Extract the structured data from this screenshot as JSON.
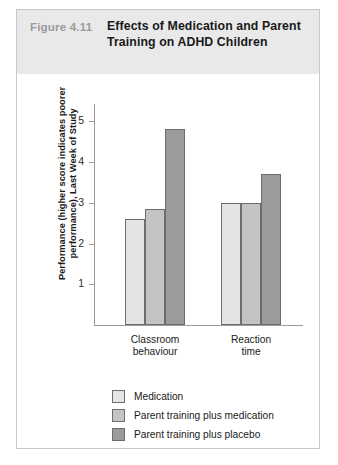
{
  "figure": {
    "number": "Figure 4.11",
    "title": "Effects of Medication and Parent Training on ADHD Children"
  },
  "chart_data": {
    "type": "bar",
    "title": "Effects of Medication and Parent Training on ADHD Children",
    "xlabel": "",
    "ylabel": "Performance (higher score indicates poorer performance), Last Week of Study",
    "categories": [
      "Classroom behaviour",
      "Reaction time"
    ],
    "series": [
      {
        "name": "Medication",
        "values": [
          2.6,
          3.0
        ],
        "color": "#e4e4e4"
      },
      {
        "name": "Parent training plus medication",
        "values": [
          2.85,
          3.0
        ],
        "color": "#c4c4c4"
      },
      {
        "name": "Parent training plus placebo",
        "values": [
          4.8,
          3.7
        ],
        "color": "#9b9b9b"
      }
    ],
    "yticks": [
      1,
      2,
      3,
      4,
      5
    ],
    "ylim": [
      0,
      5.45
    ],
    "grid": false,
    "legend_position": "bottom-left"
  },
  "colors": {
    "header_band": "#e9e9e9",
    "figure_number": "#9a9a9a",
    "title_text": "#1a1a1a",
    "axis_line": "#9c9c9c",
    "bar_outline": "#6d6d6d",
    "box_border": "#c8c8c8"
  }
}
